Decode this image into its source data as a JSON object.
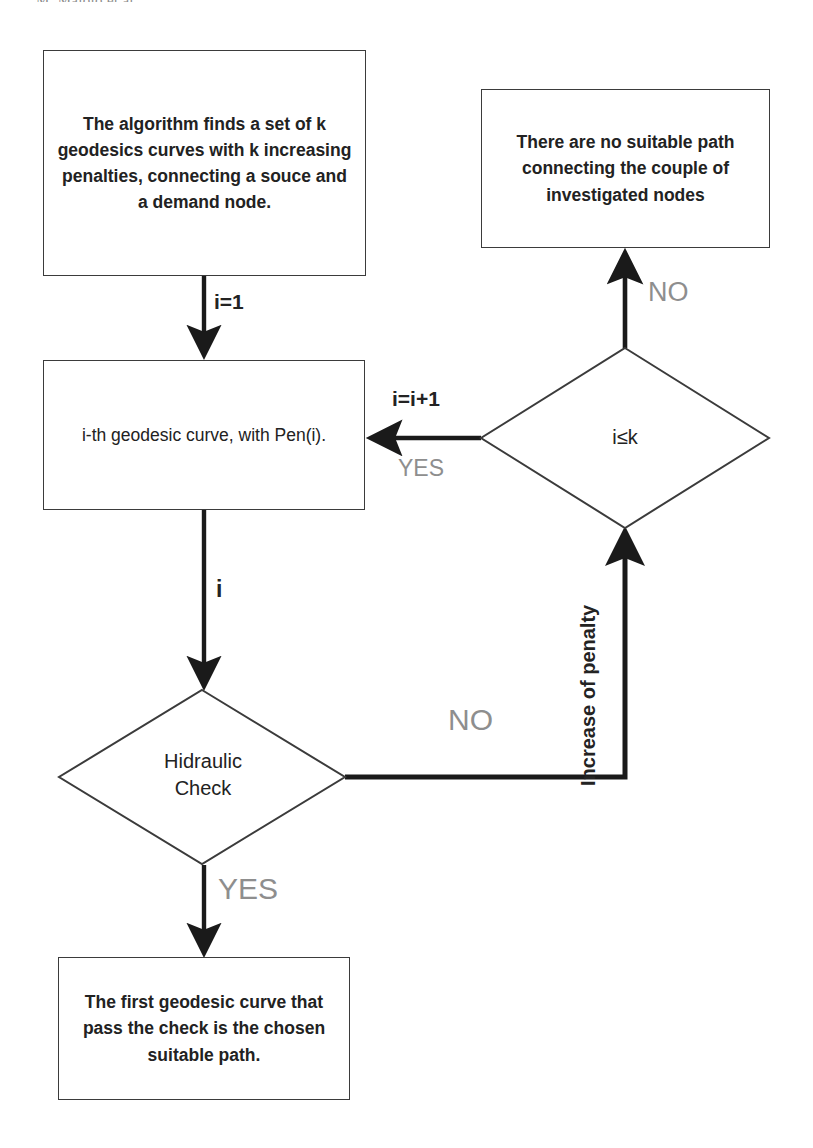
{
  "page": {
    "width": 813,
    "height": 1148,
    "background": "#ffffff",
    "running_header": "M. Maiolo et al."
  },
  "theme": {
    "stroke": "#3b3b3b",
    "thick_stroke": "#1a1a1a",
    "text": "#222222",
    "muted_label": "#8e8e8e"
  },
  "diagram": {
    "type": "flowchart",
    "nodes": [
      {
        "id": "start-process",
        "shape": "rectangle",
        "text": "The algorithm finds a set of k geodesics curves with k increasing penalties, connecting a souce and a demand node."
      },
      {
        "id": "no-path-terminal",
        "shape": "rectangle",
        "text": "There are no suitable path connecting the couple of investigated nodes"
      },
      {
        "id": "ith-geodesic",
        "shape": "rectangle",
        "text": "i-th geodesic curve, with Pen(i)."
      },
      {
        "id": "counter-decision",
        "shape": "diamond",
        "text": "i≤k"
      },
      {
        "id": "hidraulic-check-decision",
        "shape": "diamond",
        "text_line1": "Hidraulic",
        "text_line2": "Check"
      },
      {
        "id": "chosen-path-terminal",
        "shape": "rectangle",
        "text": "The first geodesic curve that pass the check is the chosen suitable path."
      }
    ],
    "edge_labels": {
      "init_counter": "i=1",
      "increment_counter": "i=i+1",
      "counter_yes": "YES",
      "counter_no": "NO",
      "current_index": "i",
      "check_no": "NO",
      "check_yes": "YES",
      "penalty_increase": "Increase of penalty"
    }
  }
}
